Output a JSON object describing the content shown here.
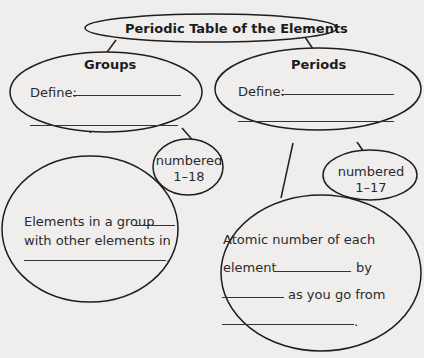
{
  "diagram": {
    "title": "Periodic Table of the Elements",
    "groups": {
      "heading": "Groups",
      "define_label": "Define:",
      "numbered_line1": "numbered",
      "numbered_line2": "1–18",
      "detail_line1": "Elements in a group",
      "detail_line2": "with other elements in",
      "detail_end": "."
    },
    "periods": {
      "heading": "Periods",
      "define_label": "Define:",
      "numbered_line1": "numbered",
      "numbered_line2": "1–17",
      "detail_line1": "Atomic number of each",
      "detail_line2_start": "element",
      "detail_line2_end": "by",
      "detail_line3_end": "as you go from",
      "detail_end": "."
    }
  },
  "colors": {
    "background": "#efeeec",
    "stroke": "#1e1e1e",
    "text": "#2a2a2a"
  }
}
